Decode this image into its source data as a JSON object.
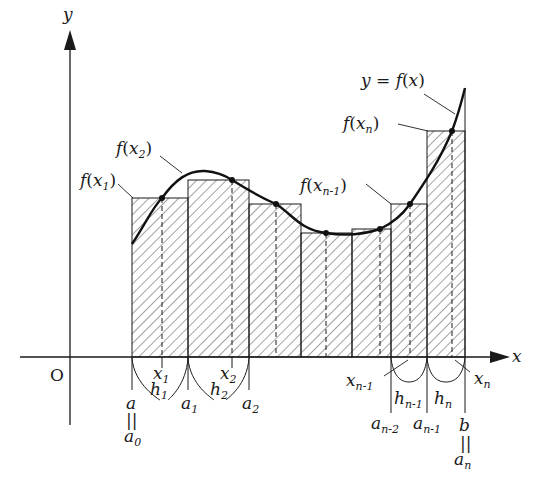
{
  "figure": {
    "colors": {
      "ink": "#1a1a1a",
      "hatch": "#333333",
      "background": "#ffffff"
    }
  },
  "axes": {
    "x_label": "x",
    "y_label": "y",
    "origin_label": "O"
  },
  "curve": {
    "label": "y = f(x)",
    "label_parts": {
      "y": "y",
      "eq": " = ",
      "f": "f",
      "open": "(",
      "x": "x",
      "close": ")"
    }
  },
  "value_labels": [
    {
      "id": "f_x1",
      "f": "f",
      "x": "x",
      "sub": "1"
    },
    {
      "id": "f_x2",
      "f": "f",
      "x": "x",
      "sub": "2"
    },
    {
      "id": "f_xn1",
      "f": "f",
      "x": "x",
      "sub": "n-1"
    },
    {
      "id": "f_xn",
      "f": "f",
      "x": "x",
      "sub": "n"
    }
  ],
  "sample_points": [
    {
      "base": "x",
      "sub": "1"
    },
    {
      "base": "x",
      "sub": "2"
    },
    {
      "base": "x",
      "sub": "n-1"
    },
    {
      "base": "x",
      "sub": "n"
    }
  ],
  "widths": [
    {
      "base": "h",
      "sub": "1"
    },
    {
      "base": "h",
      "sub": "2"
    },
    {
      "base": "h",
      "sub": "n-1"
    },
    {
      "base": "h",
      "sub": "n"
    }
  ],
  "partition_points": [
    {
      "base": "a",
      "sub": "0",
      "alias": "a",
      "eq": "||"
    },
    {
      "base": "a",
      "sub": "1"
    },
    {
      "base": "a",
      "sub": "2"
    },
    {
      "base": "a",
      "sub": "n-2"
    },
    {
      "base": "a",
      "sub": "n-1"
    },
    {
      "base": "a",
      "sub": "n",
      "alias": "b",
      "eq": "||"
    }
  ],
  "rectangles": [
    {
      "x0": 132,
      "x1": 188,
      "top": 198,
      "sample_x": 162
    },
    {
      "x0": 188,
      "x1": 249,
      "top": 180,
      "sample_x": 232
    },
    {
      "x0": 249,
      "x1": 301,
      "top": 204,
      "sample_x": 276
    },
    {
      "x0": 301,
      "x1": 352,
      "top": 233,
      "sample_x": 326
    },
    {
      "x0": 352,
      "x1": 391,
      "top": 229,
      "sample_x": 380
    },
    {
      "x0": 391,
      "x1": 427,
      "top": 204,
      "sample_x": 410
    },
    {
      "x0": 427,
      "x1": 465,
      "top": 131,
      "sample_x": 452
    }
  ]
}
